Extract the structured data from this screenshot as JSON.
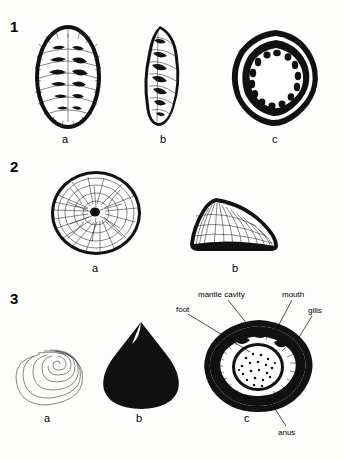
{
  "plate": {
    "title": "Mollusc shell and anatomy plate",
    "groups": [
      {
        "number": "1",
        "figures": [
          {
            "label": "a",
            "name": "chiton-dorsal-view"
          },
          {
            "label": "b",
            "name": "chiton-lateral-view"
          },
          {
            "label": "c",
            "name": "chiton-ventral-view"
          }
        ]
      },
      {
        "number": "2",
        "figures": [
          {
            "label": "a",
            "name": "limpet-dorsal-view"
          },
          {
            "label": "b",
            "name": "limpet-lateral-view"
          }
        ]
      },
      {
        "number": "3",
        "figures": [
          {
            "label": "a",
            "name": "gastropod-spiral-apex-view"
          },
          {
            "label": "b",
            "name": "gastropod-shell-dorsal-view"
          },
          {
            "label": "c",
            "name": "gastropod-anatomy-ventral-view"
          }
        ]
      }
    ],
    "annotations": [
      {
        "text": "mantle cavity",
        "name": "annotation-mantle-cavity"
      },
      {
        "text": "mouth",
        "name": "annotation-mouth"
      },
      {
        "text": "foot",
        "name": "annotation-foot"
      },
      {
        "text": "gills",
        "name": "annotation-gills"
      },
      {
        "text": "anus",
        "name": "annotation-anus"
      }
    ],
    "colors": {
      "ink": "#111111",
      "paper": "#fdfdfb"
    }
  }
}
